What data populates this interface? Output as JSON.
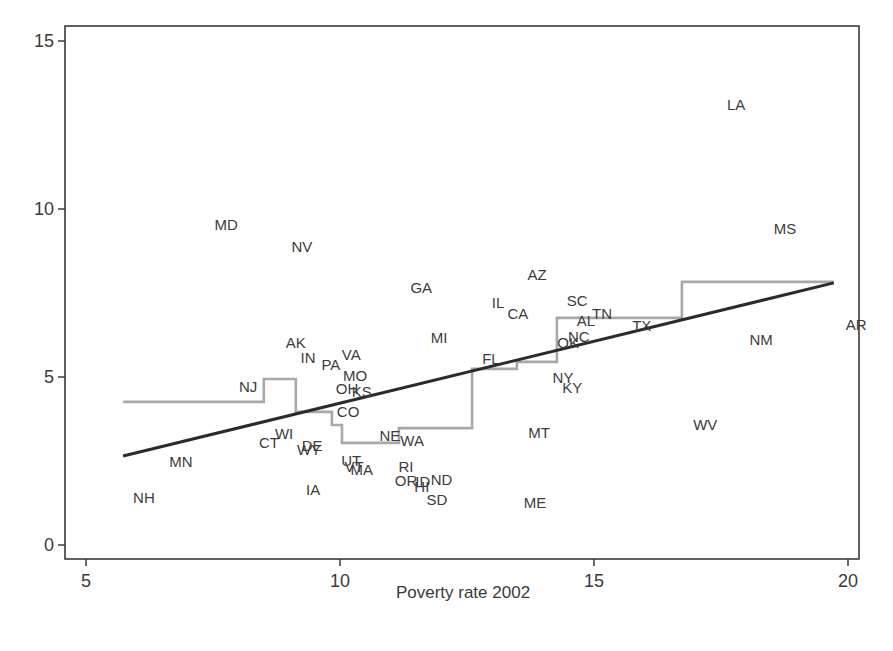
{
  "chart_data": {
    "type": "scatter",
    "title": "",
    "xlabel": "Poverty rate 2002",
    "ylabel": "",
    "xlim": [
      4.6,
      20.4
    ],
    "ylim": [
      -0.4,
      15.45
    ],
    "x_ticks": [
      5,
      10,
      15,
      20
    ],
    "y_ticks": [
      0,
      5,
      10,
      15
    ],
    "grid": false,
    "legend": null,
    "marker": "state-abbreviation-labels",
    "points": [
      {
        "label": "LA",
        "x": 17.8,
        "y": 13.1
      },
      {
        "label": "MD",
        "x": 7.76,
        "y": 9.55
      },
      {
        "label": "NV",
        "x": 9.25,
        "y": 8.9
      },
      {
        "label": "MS",
        "x": 18.76,
        "y": 9.43
      },
      {
        "label": "AZ",
        "x": 13.88,
        "y": 8.04
      },
      {
        "label": "GA",
        "x": 11.6,
        "y": 7.68
      },
      {
        "label": "SC",
        "x": 14.67,
        "y": 7.29
      },
      {
        "label": "IL",
        "x": 13.11,
        "y": 7.23
      },
      {
        "label": "CA",
        "x": 13.5,
        "y": 6.9
      },
      {
        "label": "TN",
        "x": 15.16,
        "y": 6.9
      },
      {
        "label": "AL",
        "x": 14.84,
        "y": 6.67
      },
      {
        "label": "AR",
        "x": 20.16,
        "y": 6.55
      },
      {
        "label": "TX",
        "x": 15.94,
        "y": 6.52
      },
      {
        "label": "MI",
        "x": 11.95,
        "y": 6.19
      },
      {
        "label": "NM",
        "x": 18.29,
        "y": 6.13
      },
      {
        "label": "NC",
        "x": 14.7,
        "y": 6.22
      },
      {
        "label": "OK",
        "x": 14.49,
        "y": 6.04
      },
      {
        "label": "AK",
        "x": 9.13,
        "y": 6.04
      },
      {
        "label": "IN",
        "x": 9.37,
        "y": 5.57
      },
      {
        "label": "VA",
        "x": 10.22,
        "y": 5.68
      },
      {
        "label": "FL",
        "x": 12.97,
        "y": 5.54
      },
      {
        "label": "PA",
        "x": 9.82,
        "y": 5.36
      },
      {
        "label": "MO",
        "x": 10.3,
        "y": 5.06
      },
      {
        "label": "NY",
        "x": 14.39,
        "y": 5.0
      },
      {
        "label": "NJ",
        "x": 8.19,
        "y": 4.73
      },
      {
        "label": "OH",
        "x": 10.14,
        "y": 4.67
      },
      {
        "label": "KS",
        "x": 10.43,
        "y": 4.58
      },
      {
        "label": "KY",
        "x": 14.57,
        "y": 4.7
      },
      {
        "label": "CO",
        "x": 10.16,
        "y": 3.96
      },
      {
        "label": "WV",
        "x": 17.19,
        "y": 3.6
      },
      {
        "label": "MT",
        "x": 13.92,
        "y": 3.36
      },
      {
        "label": "WI",
        "x": 8.9,
        "y": 3.33
      },
      {
        "label": "CT",
        "x": 8.6,
        "y": 3.04
      },
      {
        "label": "NE",
        "x": 10.98,
        "y": 3.27
      },
      {
        "label": "WA",
        "x": 11.42,
        "y": 3.1
      },
      {
        "label": "DE",
        "x": 9.45,
        "y": 2.95
      },
      {
        "label": "WY",
        "x": 9.39,
        "y": 2.83
      },
      {
        "label": "MN",
        "x": 6.87,
        "y": 2.5
      },
      {
        "label": "UT",
        "x": 10.22,
        "y": 2.53
      },
      {
        "label": "VT",
        "x": 10.28,
        "y": 2.35
      },
      {
        "label": "MA",
        "x": 10.43,
        "y": 2.26
      },
      {
        "label": "RI",
        "x": 11.3,
        "y": 2.35
      },
      {
        "label": "OR",
        "x": 11.3,
        "y": 1.93
      },
      {
        "label": "ID",
        "x": 11.63,
        "y": 1.9
      },
      {
        "label": "ND",
        "x": 12.0,
        "y": 1.96
      },
      {
        "label": "HI",
        "x": 11.61,
        "y": 1.73
      },
      {
        "label": "SD",
        "x": 11.91,
        "y": 1.37
      },
      {
        "label": "IA",
        "x": 9.47,
        "y": 1.64
      },
      {
        "label": "ME",
        "x": 13.84,
        "y": 1.28
      },
      {
        "label": "NH",
        "x": 6.14,
        "y": 1.43
      }
    ],
    "series": [
      {
        "name": "linear fit",
        "type": "line",
        "color": "#2b2b2b",
        "x": [
          5.73,
          19.72
        ],
        "y": [
          2.65,
          7.8
        ]
      },
      {
        "name": "step (median band) fit",
        "type": "step",
        "color": "#a8a8a8",
        "x": [
          5.73,
          8.5,
          8.5,
          9.13,
          9.13,
          9.84,
          9.84,
          10.04,
          10.04,
          11.16,
          11.16,
          12.6,
          12.6,
          13.48,
          13.48,
          14.27,
          14.27,
          16.73,
          16.73,
          19.72
        ],
        "y": [
          4.26,
          4.26,
          4.94,
          4.94,
          3.96,
          3.96,
          3.57,
          3.57,
          3.04,
          3.04,
          3.48,
          3.48,
          5.24,
          5.24,
          5.45,
          5.45,
          6.76,
          6.76,
          7.83,
          7.83
        ]
      }
    ]
  },
  "colors": {
    "frame": "#3a3a3a",
    "text": "#3a3a3a",
    "fit_line": "#2b2b2b",
    "step_line": "#a8a8a8",
    "background": "#ffffff"
  }
}
